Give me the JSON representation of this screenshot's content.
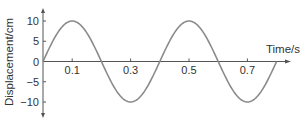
{
  "chart_data": {
    "type": "line",
    "title": "",
    "xlabel": "Time/s",
    "ylabel": "Displacement/cm",
    "x_ticks": [
      0.1,
      0.3,
      0.5,
      0.7
    ],
    "x_tick_labels": [
      "0.1",
      "0.3",
      "0.5",
      "0.7"
    ],
    "y_ticks": [
      10,
      5,
      0,
      -5,
      -10
    ],
    "y_tick_labels": [
      "10",
      "5",
      "0",
      "-5",
      "-10"
    ],
    "xlim": [
      0,
      0.85
    ],
    "ylim": [
      -12,
      12
    ],
    "grid": false,
    "legend": null,
    "series": [
      {
        "name": "displacement",
        "function": "10*sin(2*pi*t/0.4)",
        "amplitude_cm": 10,
        "period_s": 0.4,
        "t_range": [
          0,
          0.8
        ],
        "x": [
          0,
          0.05,
          0.1,
          0.15,
          0.2,
          0.25,
          0.3,
          0.35,
          0.4,
          0.45,
          0.5,
          0.55,
          0.6,
          0.65,
          0.7,
          0.75,
          0.8
        ],
        "values": [
          0,
          7.07,
          10,
          7.07,
          0,
          -7.07,
          -10,
          -7.07,
          0,
          7.07,
          10,
          7.07,
          0,
          -7.07,
          -10,
          -7.07,
          0
        ]
      }
    ]
  },
  "colors": {
    "curve": "#8a8a8a",
    "axis": "#555555",
    "text": "#333333"
  }
}
